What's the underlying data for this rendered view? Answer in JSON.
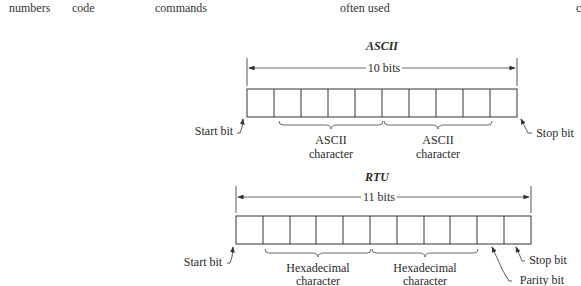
{
  "header_row": [
    {
      "text": "numbers",
      "x": 9
    },
    {
      "text": "code",
      "x": 72
    },
    {
      "text": "commands",
      "x": 155
    },
    {
      "text": "often used",
      "x": 340
    },
    {
      "text": "c",
      "x": 576
    }
  ],
  "ascii": {
    "title": "ASCII",
    "span_label": "10 bits",
    "bit_count": 10,
    "labels": {
      "start": "Start bit",
      "char1_line1": "ASCII",
      "char1_line2": "character",
      "char2_line1": "ASCII",
      "char2_line2": "character",
      "stop": "Stop bit"
    }
  },
  "rtu": {
    "title": "RTU",
    "span_label": "11 bits",
    "bit_count": 11,
    "labels": {
      "start": "Start bit",
      "char1_line1": "Hexadecimal",
      "char1_line2": "character",
      "char2_line1": "Hexadecimal",
      "char2_line2": "character",
      "parity": "Parity bit",
      "stop": "Stop bit"
    }
  }
}
